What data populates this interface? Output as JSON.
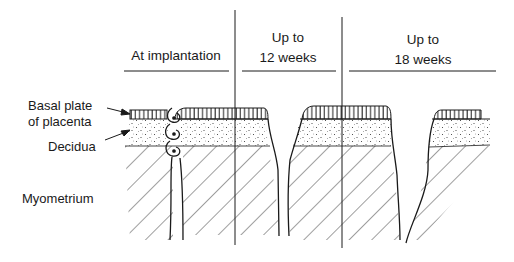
{
  "columns": [
    {
      "label": "At implantation"
    },
    {
      "label_line1": "Up to",
      "label_line2": "12 weeks"
    },
    {
      "label_line1": "Up to",
      "label_line2": "18 weeks"
    }
  ],
  "layer_labels": {
    "basal_plate_line1": "Basal plate",
    "basal_plate_line2": "of placenta",
    "decidua": "Decidua",
    "myometrium": "Myometrium"
  },
  "colors": {
    "ink": "#1a1a1a",
    "background": "#ffffff"
  }
}
